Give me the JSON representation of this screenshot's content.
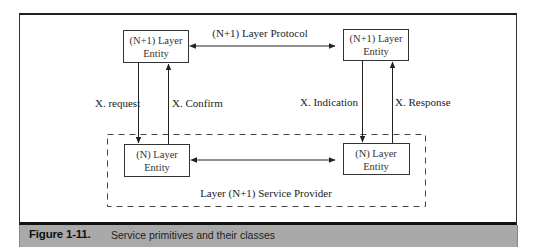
{
  "diagram": {
    "entities": {
      "top_left": {
        "line1": "(N+1) Layer",
        "line2": "Entity"
      },
      "top_right": {
        "line1": "(N+1) Layer",
        "line2": "Entity"
      },
      "bottom_left": {
        "line1": "(N) Layer",
        "line2": "Entity"
      },
      "bottom_right": {
        "line1": "(N) Layer",
        "line2": "Entity"
      }
    },
    "protocol_label": "(N+1) Layer Protocol",
    "primitives": {
      "request": "X. request",
      "confirm": "X. Confirm",
      "indication": "X. Indication",
      "response": "X. Response"
    },
    "service_provider_label": "Layer (N+1) Service Provider"
  },
  "caption": {
    "number": "Figure 1-11.",
    "text": "Service primitives and their classes",
    "bar_color": "#a9a9a9"
  }
}
